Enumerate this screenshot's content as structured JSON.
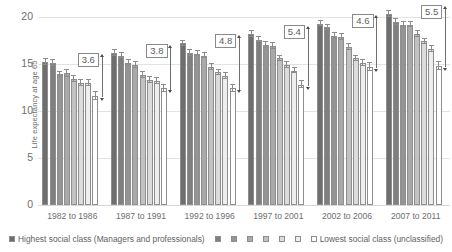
{
  "chart_data": {
    "type": "bar",
    "title": "",
    "xlabel": "",
    "ylabel": "Life expectancy at age 65",
    "ylim": [
      0,
      20
    ],
    "yticks": [
      0,
      5,
      10,
      15,
      20
    ],
    "grid": true,
    "legend_position": "bottom",
    "categories": [
      "1982 to 1986",
      "1987 to 1991",
      "1992 to 1996",
      "1997 to 2001",
      "2002 to 2006",
      "2007 to 2011"
    ],
    "series": [
      {
        "name": "Highest social class (Managers and professionals)",
        "values": [
          15.2,
          16.2,
          17.2,
          18.2,
          19.3,
          20.3
        ],
        "color": "#6e6e6e"
      },
      {
        "name": "Social class 2",
        "values": [
          15.1,
          15.9,
          16.2,
          17.6,
          18.9,
          19.5
        ],
        "color": "#7f7f7f"
      },
      {
        "name": "Social class 3",
        "values": [
          13.9,
          15.1,
          16.1,
          17.0,
          18.0,
          19.2
        ],
        "color": "#949494"
      },
      {
        "name": "Social class 4",
        "values": [
          14.0,
          14.9,
          15.9,
          16.9,
          17.9,
          19.2
        ],
        "color": "#a9a9a9"
      },
      {
        "name": "Social class 5",
        "values": [
          13.4,
          13.8,
          14.7,
          15.6,
          16.8,
          18.2
        ],
        "color": "#c2c2c2"
      },
      {
        "name": "Social class 6",
        "values": [
          13.0,
          13.3,
          14.1,
          14.9,
          15.6,
          17.4
        ],
        "color": "#dcdcdc"
      },
      {
        "name": "Social class 7",
        "values": [
          13.0,
          13.2,
          13.7,
          14.3,
          15.1,
          16.6
        ],
        "color": "#eeeeee"
      },
      {
        "name": "Lowest social class (unclassified)",
        "values": [
          11.6,
          12.4,
          12.4,
          12.8,
          14.7,
          14.8
        ],
        "color": "#ffffff"
      }
    ],
    "error_values": [
      [
        0.35,
        0.35,
        0.3,
        0.35,
        0.3,
        0.3,
        0.3,
        0.4
      ],
      [
        0.3,
        0.3,
        0.3,
        0.3,
        0.3,
        0.3,
        0.3,
        0.4
      ],
      [
        0.3,
        0.3,
        0.3,
        0.3,
        0.3,
        0.3,
        0.3,
        0.4
      ],
      [
        0.3,
        0.3,
        0.3,
        0.3,
        0.3,
        0.3,
        0.3,
        0.4
      ],
      [
        0.3,
        0.3,
        0.3,
        0.3,
        0.3,
        0.3,
        0.3,
        0.4
      ],
      [
        0.3,
        0.3,
        0.3,
        0.3,
        0.3,
        0.3,
        0.3,
        0.4
      ]
    ],
    "gap_annotations": [
      {
        "label": "3.6",
        "group": "1982 to 1986",
        "top": 15.2,
        "bottom": 11.6
      },
      {
        "label": "3.8",
        "group": "1987 to 1991",
        "top": 16.2,
        "bottom": 12.4
      },
      {
        "label": "4.8",
        "group": "1992 to 1996",
        "top": 17.2,
        "bottom": 12.4
      },
      {
        "label": "5.4",
        "group": "1997 to 2001",
        "top": 18.2,
        "bottom": 12.8
      },
      {
        "label": "4.6",
        "group": "2002 to 2006",
        "top": 19.3,
        "bottom": 14.7
      },
      {
        "label": "5.5",
        "group": "2007 to 2011",
        "top": 20.3,
        "bottom": 14.8
      }
    ]
  },
  "axes": {
    "y_title": "Life expectancy at age 65",
    "y_ticks": [
      "20",
      "15",
      "10",
      "5",
      "0"
    ],
    "x_ticks": [
      "1982 to 1986",
      "1987 to 1991",
      "1992 to 1996",
      "1997 to 2001",
      "2002 to 2006",
      "2007 to 2011"
    ]
  },
  "legend": {
    "highest_label": "Highest social class (Managers and professionals)",
    "lowest_label": "Lowest social class (unclassified)",
    "swatch_colors": [
      "#6e6e6e",
      "#7f7f7f",
      "#949494",
      "#a9a9a9",
      "#c2c2c2",
      "#dcdcdc",
      "#eeeeee",
      "#ffffff"
    ]
  },
  "colors": {
    "gridline": "#e3e3e3",
    "bar_border": "#8e8e8e",
    "text": "#6e6e6e",
    "annotation": "#5d5d5d"
  }
}
